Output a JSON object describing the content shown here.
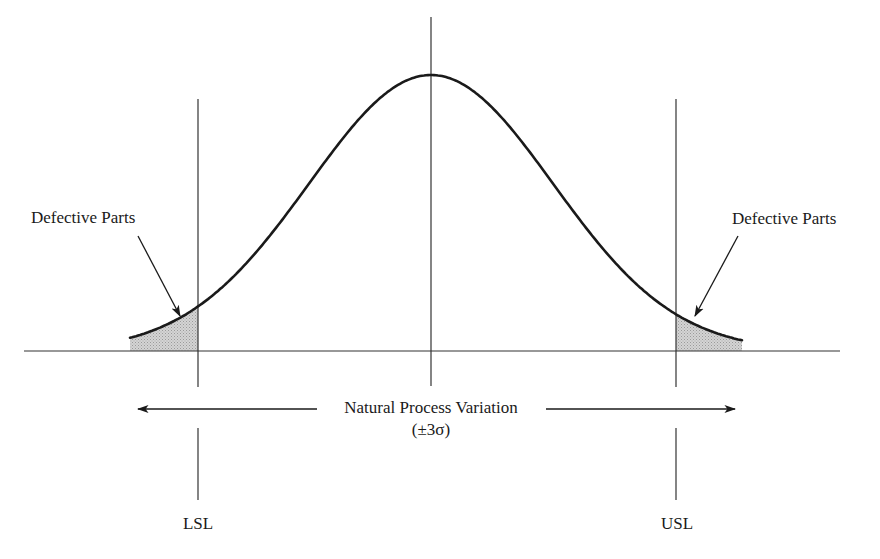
{
  "chart_data": {
    "type": "line",
    "title": "",
    "distribution": {
      "name": "normal",
      "mean_px": 431,
      "sigma_px": 122,
      "peak_y_px": 75,
      "baseline_y_px": 351,
      "x_start_px": 130,
      "x_end_px": 742
    },
    "spec_limits": [
      {
        "label": "LSL",
        "x_px": 198
      },
      {
        "label": "USL",
        "x_px": 676
      }
    ],
    "center_line_x_px": 431,
    "shaded_regions": [
      {
        "label": "Defective Parts",
        "from_px": 130,
        "to_px": 198
      },
      {
        "label": "Defective Parts",
        "from_px": 676,
        "to_px": 742
      }
    ],
    "annotations": [
      "Defective Parts",
      "Defective Parts",
      "Natural Process Variation",
      "(±3σ)",
      "LSL",
      "USL"
    ],
    "xlabel": "",
    "ylabel": "",
    "grid": false,
    "legend": null
  },
  "labels": {
    "defective_left": "Defective Parts",
    "defective_right": "Defective Parts",
    "variation": "Natural Process Variation",
    "sigma": "(±3σ)",
    "lsl": "LSL",
    "usl": "USL"
  },
  "colors": {
    "line": "#1a1a1a",
    "thin_line": "#333333",
    "shade": "#c8c8c8"
  }
}
